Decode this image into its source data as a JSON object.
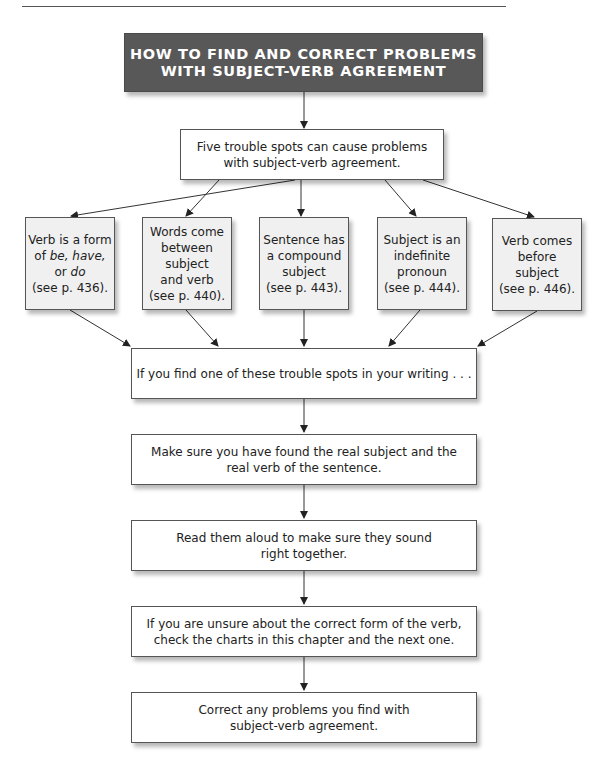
{
  "header": {
    "title_line1": "HOW TO FIND AND CORRECT PROBLEMS",
    "title_line2": "WITH SUBJECT-VERB AGREEMENT"
  },
  "intro": {
    "line1": "Five trouble spots can cause problems",
    "line2": "with subject-verb agreement."
  },
  "trouble_spots": [
    {
      "line1": "Verb is a form",
      "line2_pre": "of ",
      "line2_italic": "be, have,",
      "line3_pre": "or ",
      "line3_italic": "do",
      "ref": "(see p. 436)."
    },
    {
      "line1": "Words come",
      "line2": "between subject",
      "line3": "and verb",
      "ref": "(see p. 440)."
    },
    {
      "line1": "Sentence has",
      "line2": "a compound",
      "line3": "subject",
      "ref": "(see p. 443)."
    },
    {
      "line1": "Subject is an",
      "line2": "indefinite",
      "line3": "pronoun",
      "ref": "(see p. 444)."
    },
    {
      "line1": "Verb comes",
      "line2": "before subject",
      "ref": "(see p. 446)."
    }
  ],
  "steps": [
    {
      "line1": "If you find one of these trouble spots in your writing . . ."
    },
    {
      "line1": "Make sure you have found the real subject and the",
      "line2": "real verb of the sentence."
    },
    {
      "line1": "Read them aloud to make sure they sound",
      "line2": "right together."
    },
    {
      "line1": "If you are unsure about the correct form of the verb,",
      "line2": "check the charts in this chapter and the next one."
    },
    {
      "line1": "Correct any problems you find with",
      "line2": "subject-verb agreement."
    }
  ],
  "colors": {
    "header_bg": "#585858",
    "small_box_bg": "#f0f0f0",
    "line": "#333333"
  }
}
